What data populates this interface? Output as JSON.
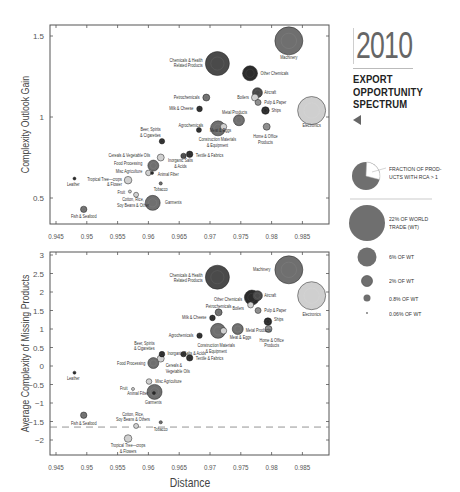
{
  "panel": {
    "year": "2010",
    "title_lines": [
      "EXPORT",
      "OPPORTUNITY",
      "SPECTRUM"
    ],
    "arrow_icon": "left-triangle"
  },
  "legend": {
    "pie_label": "FRACTION OF PROD-UCTS WITH RCA > 1",
    "pie_label_lines": [
      "FRACTION OF PROD-",
      "UCTS WITH RCA > 1"
    ],
    "sizes": [
      {
        "label_lines": [
          "22% OF WORLD",
          "TRADE (WT)"
        ],
        "r": 18
      },
      {
        "label_lines": [
          "6% OF WT"
        ],
        "r": 9.5
      },
      {
        "label_lines": [
          "2% OF WT"
        ],
        "r": 5.5
      },
      {
        "label_lines": [
          "0.8% OF WT"
        ],
        "r": 3.5
      },
      {
        "label_lines": [
          "0.06% OF WT"
        ],
        "r": 0.9
      }
    ]
  },
  "colors": {
    "dark": "#2b2b2b",
    "darkgray": "#4a4a4a",
    "mid": "#6f6f6f",
    "midlight": "#8c8c8c",
    "light": "#cfcfcf",
    "frame": "#555555",
    "dashed": "#777777"
  },
  "chart_data": [
    {
      "type": "scatter",
      "title": "",
      "xlabel": "",
      "ylabel": "Complexity Outlook Gain",
      "xlim": [
        0.943,
        0.9895
      ],
      "ylim": [
        0.36,
        1.56
      ],
      "xticks": [
        0.945,
        0.95,
        0.955,
        0.96,
        0.965,
        0.97,
        0.975,
        0.98,
        0.985
      ],
      "xtick_labels": [
        "0.945",
        "0.95",
        "0.955",
        "0.96",
        "0.965",
        "0.97",
        "0.975",
        "0.98",
        "0.985"
      ],
      "yticks": [
        0.5,
        1,
        1.5
      ],
      "ytick_labels": [
        "0.5",
        "1",
        "1.5"
      ],
      "points": [
        {
          "name": "Machinery",
          "x": 0.9828,
          "y": 1.47,
          "r": 14,
          "fill": "mid",
          "label": [
            "Machinery"
          ],
          "lx": 0.9828,
          "ly": 1.37,
          "anchor": "middle"
        },
        {
          "name": "Chemicals & Health Related Products",
          "x": 0.9712,
          "y": 1.33,
          "r": 12,
          "fill": "darkgray",
          "label": [
            "Chemicals & Health",
            "Related Products"
          ],
          "lx": 0.9688,
          "ly": 1.35,
          "anchor": "end"
        },
        {
          "name": "Other Chemicals",
          "x": 0.9765,
          "y": 1.27,
          "r": 7.5,
          "fill": "dark",
          "label": [
            "Other Chemicals"
          ],
          "lx": 0.9782,
          "ly": 1.27,
          "anchor": "start"
        },
        {
          "name": "Electronics",
          "x": 0.9865,
          "y": 1.04,
          "r": 14,
          "fill": "light",
          "label": [
            "Electronics"
          ],
          "lx": 0.9865,
          "ly": 0.95,
          "anchor": "middle"
        },
        {
          "name": "Aircraft",
          "x": 0.9777,
          "y": 1.15,
          "r": 5,
          "fill": "darkgray",
          "label": [
            "Aircraft"
          ],
          "lx": 0.9788,
          "ly": 1.15,
          "anchor": "start"
        },
        {
          "name": "Boilers",
          "x": 0.9773,
          "y": 1.12,
          "r": 3.5,
          "fill": "light",
          "label": [
            "Boilers"
          ],
          "lx": 0.9763,
          "ly": 1.12,
          "anchor": "end"
        },
        {
          "name": "Pulp & Paper",
          "x": 0.9778,
          "y": 1.09,
          "r": 3,
          "fill": "midlight",
          "label": [
            "Pulp & Paper"
          ],
          "lx": 0.9788,
          "ly": 1.09,
          "anchor": "start"
        },
        {
          "name": "Ships",
          "x": 0.979,
          "y": 1.04,
          "r": 3.8,
          "fill": "dark",
          "label": [
            "Ships"
          ],
          "lx": 0.98,
          "ly": 1.04,
          "anchor": "start"
        },
        {
          "name": "Petrochemicals",
          "x": 0.9694,
          "y": 1.12,
          "r": 3.5,
          "fill": "mid",
          "label": [
            "Petrochemicals"
          ],
          "lx": 0.9683,
          "ly": 1.12,
          "anchor": "end"
        },
        {
          "name": "Milk & Cheese",
          "x": 0.9683,
          "y": 1.05,
          "r": 2.8,
          "fill": "dark",
          "label": [
            "Milk & Cheese"
          ],
          "lx": 0.9673,
          "ly": 1.05,
          "anchor": "end"
        },
        {
          "name": "Metal Products",
          "x": 0.9747,
          "y": 0.98,
          "r": 5.5,
          "fill": "mid",
          "label": [
            "Metal Products"
          ],
          "lx": 0.974,
          "ly": 1.03,
          "anchor": "middle"
        },
        {
          "name": "Home & Office Products",
          "x": 0.9792,
          "y": 0.94,
          "r": 3.5,
          "fill": "midlight",
          "label": [
            "Home & Office",
            "Products"
          ],
          "lx": 0.979,
          "ly": 0.88,
          "anchor": "middle"
        },
        {
          "name": "Construction Materials & Equipment",
          "x": 0.9713,
          "y": 0.93,
          "r": 7.5,
          "fill": "mid",
          "label": [
            "Construction Materials",
            "& Equipment"
          ],
          "lx": 0.9712,
          "ly": 0.86,
          "anchor": "middle"
        },
        {
          "name": "Meat & Eggs",
          "x": 0.9722,
          "y": 0.94,
          "r": 3.2,
          "fill": "light",
          "label": [
            "Meat & Eggs"
          ],
          "lx": 0.9717,
          "ly": 0.915,
          "anchor": "middle"
        },
        {
          "name": "Agrochemicals",
          "x": 0.9682,
          "y": 0.92,
          "r": 2.5,
          "fill": "dark",
          "label": [
            "Agrochemicals"
          ],
          "lx": 0.9689,
          "ly": 0.945,
          "anchor": "end"
        },
        {
          "name": "Beer, Spirits & Cigarettes",
          "x": 0.9622,
          "y": 0.85,
          "r": 2.7,
          "fill": "dark",
          "label": [
            "Beer, Spirits",
            "& Cigarettes"
          ],
          "lx": 0.962,
          "ly": 0.92,
          "anchor": "end"
        },
        {
          "name": "Textile & Fabrics",
          "x": 0.9667,
          "y": 0.77,
          "r": 3.2,
          "fill": "dark",
          "label": [
            "Textile & Fabrics"
          ],
          "lx": 0.9677,
          "ly": 0.765,
          "anchor": "start"
        },
        {
          "name": "Inorganic Salts & Acids",
          "x": 0.9657,
          "y": 0.76,
          "r": 2.7,
          "fill": "darkgray",
          "label": [
            "Inorganic Salts",
            "& Acids"
          ],
          "lx": 0.9652,
          "ly": 0.73,
          "anchor": "middle"
        },
        {
          "name": "Cereals & Vegetable Oils",
          "x": 0.962,
          "y": 0.75,
          "r": 3.5,
          "fill": "light",
          "label": [
            "Cereals & Vegetable Oils"
          ],
          "lx": 0.9603,
          "ly": 0.765,
          "anchor": "end"
        },
        {
          "name": "Food Processing",
          "x": 0.9608,
          "y": 0.7,
          "r": 5.5,
          "fill": "mid",
          "label": [
            "Food Processing"
          ],
          "lx": 0.959,
          "ly": 0.71,
          "anchor": "end"
        },
        {
          "name": "Misc Agriculture",
          "x": 0.96,
          "y": 0.655,
          "r": 2.8,
          "fill": "light",
          "label": [
            "Misc Agriculture"
          ],
          "lx": 0.959,
          "ly": 0.665,
          "anchor": "end"
        },
        {
          "name": "Animal Fiber",
          "x": 0.9606,
          "y": 0.655,
          "r": 1.5,
          "fill": "dark",
          "label": [
            "Animal Fiber"
          ],
          "lx": 0.9615,
          "ly": 0.645,
          "anchor": "start"
        },
        {
          "name": "Tropical Tree-crops & Flower",
          "x": 0.9567,
          "y": 0.61,
          "r": 3.8,
          "fill": "light",
          "label": [
            "Tropical Tree—crops",
            "& Flower"
          ],
          "lx": 0.9557,
          "ly": 0.615,
          "anchor": "end"
        },
        {
          "name": "Leather",
          "x": 0.948,
          "y": 0.62,
          "r": 1.5,
          "fill": "dark",
          "label": [
            "Leather"
          ],
          "lx": 0.9478,
          "ly": 0.585,
          "anchor": "middle"
        },
        {
          "name": "Tobacco",
          "x": 0.962,
          "y": 0.59,
          "r": 1.6,
          "fill": "mid",
          "label": [
            "Tobacco"
          ],
          "lx": 0.962,
          "ly": 0.555,
          "anchor": "middle"
        },
        {
          "name": "Fruit",
          "x": 0.957,
          "y": 0.54,
          "r": 1.5,
          "fill": "light",
          "label": [
            "Fruit"
          ],
          "lx": 0.9562,
          "ly": 0.535,
          "anchor": "end"
        },
        {
          "name": "Cotton, Rice, Soy Beans & Others",
          "x": 0.958,
          "y": 0.52,
          "r": 2.5,
          "fill": "light",
          "label": [
            "Cotton, Rice,",
            "Soy Beans & Other"
          ],
          "lx": 0.9575,
          "ly": 0.49,
          "anchor": "middle"
        },
        {
          "name": "Garments",
          "x": 0.9607,
          "y": 0.47,
          "r": 7.5,
          "fill": "mid",
          "label": [
            "Garments"
          ],
          "lx": 0.9627,
          "ly": 0.47,
          "anchor": "start"
        },
        {
          "name": "Fish & Seafood",
          "x": 0.9495,
          "y": 0.43,
          "r": 3.2,
          "fill": "mid",
          "label": [
            "Fish & Seafood"
          ],
          "lx": 0.9495,
          "ly": 0.385,
          "anchor": "middle"
        }
      ]
    },
    {
      "type": "scatter",
      "title": "",
      "xlabel": "Distance",
      "ylabel": "Average Complexity of Missing Products",
      "xlim": [
        0.943,
        0.9895
      ],
      "ylim": [
        -2.4,
        3.03
      ],
      "xticks": [
        0.945,
        0.95,
        0.955,
        0.96,
        0.965,
        0.97,
        0.975,
        0.98,
        0.985
      ],
      "xtick_labels": [
        "0.945",
        "0.95",
        "0.955",
        "0.96",
        "0.965",
        "0.97",
        "0.975",
        "0.98",
        "0.985"
      ],
      "yticks": [
        3,
        2.5,
        2,
        1.5,
        1,
        0.5,
        0,
        -0.5,
        -1,
        -1.5,
        -2
      ],
      "ytick_labels": [
        "3",
        "2.5",
        "2",
        "1.5",
        "1",
        "0.5",
        "0",
        "−0.5",
        "−1",
        "−1.5",
        "−2"
      ],
      "reference_line": {
        "y": -1.65,
        "style": "dashed"
      },
      "points": [
        {
          "name": "Machinery",
          "x": 0.9828,
          "y": 2.6,
          "r": 14,
          "fill": "mid",
          "label": [
            "Machinery"
          ],
          "lx": 0.9798,
          "ly": 2.62,
          "anchor": "end"
        },
        {
          "name": "Chemicals & Health Related Products",
          "x": 0.9712,
          "y": 2.4,
          "r": 12,
          "fill": "darkgray",
          "label": [
            "Chemicals & Health",
            "Related Products"
          ],
          "lx": 0.9688,
          "ly": 2.45,
          "anchor": "end"
        },
        {
          "name": "Electronics",
          "x": 0.9865,
          "y": 1.9,
          "r": 14,
          "fill": "light",
          "label": [
            "Electronics"
          ],
          "lx": 0.9865,
          "ly": 1.4,
          "anchor": "middle"
        },
        {
          "name": "Other Chemicals",
          "x": 0.9768,
          "y": 1.85,
          "r": 7.5,
          "fill": "dark",
          "label": [
            "Other Chemicals"
          ],
          "lx": 0.9752,
          "ly": 1.8,
          "anchor": "end"
        },
        {
          "name": "Aircraft",
          "x": 0.9777,
          "y": 1.9,
          "r": 5,
          "fill": "darkgray",
          "label": [
            "Aircraft"
          ],
          "lx": 0.9788,
          "ly": 1.9,
          "anchor": "start"
        },
        {
          "name": "Boilers",
          "x": 0.9766,
          "y": 1.65,
          "r": 3,
          "fill": "light",
          "label": [
            "Boilers"
          ],
          "lx": 0.9755,
          "ly": 1.55,
          "anchor": "end"
        },
        {
          "name": "Pulp & Paper",
          "x": 0.9778,
          "y": 1.5,
          "r": 3,
          "fill": "midlight",
          "label": [
            "Pulp & Paper"
          ],
          "lx": 0.9788,
          "ly": 1.5,
          "anchor": "start"
        },
        {
          "name": "Petrochemicals",
          "x": 0.9714,
          "y": 1.45,
          "r": 3.5,
          "fill": "mid",
          "label": [
            "Petrochemicals"
          ],
          "lx": 0.9714,
          "ly": 1.6,
          "anchor": "middle"
        },
        {
          "name": "Ships",
          "x": 0.9794,
          "y": 1.2,
          "r": 3.8,
          "fill": "dark",
          "label": [
            "Ships"
          ],
          "lx": 0.9804,
          "ly": 1.25,
          "anchor": "start"
        },
        {
          "name": "Milk & Cheese",
          "x": 0.9704,
          "y": 1.3,
          "r": 2.8,
          "fill": "dark",
          "label": [
            "Milk & Cheese"
          ],
          "lx": 0.9694,
          "ly": 1.3,
          "anchor": "end"
        },
        {
          "name": "Metal Products",
          "x": 0.9745,
          "y": 1.0,
          "r": 5.5,
          "fill": "mid",
          "label": [
            "Metal Products"
          ],
          "lx": 0.9758,
          "ly": 0.95,
          "anchor": "start"
        },
        {
          "name": "Home & Office Products",
          "x": 0.9795,
          "y": 1.0,
          "r": 3.5,
          "fill": "midlight",
          "label": [
            "Home & Office",
            "Products"
          ],
          "lx": 0.98,
          "ly": 0.7,
          "anchor": "middle"
        },
        {
          "name": "Construction Materials & Equipment",
          "x": 0.9713,
          "y": 0.95,
          "r": 7.5,
          "fill": "mid",
          "label": [
            "Construction Materials",
            "& Equipment"
          ],
          "lx": 0.971,
          "ly": 0.55,
          "anchor": "middle"
        },
        {
          "name": "Meat & Eggs",
          "x": 0.9722,
          "y": 0.95,
          "r": 3.2,
          "fill": "light",
          "label": [
            "Meat & Eggs"
          ],
          "lx": 0.9732,
          "ly": 0.78,
          "anchor": "start"
        },
        {
          "name": "Agrochemicals",
          "x": 0.9683,
          "y": 0.82,
          "r": 2.7,
          "fill": "dark",
          "label": [
            "Agrochemicals"
          ],
          "lx": 0.9673,
          "ly": 0.82,
          "anchor": "end"
        },
        {
          "name": "Beer, Spirits & Cigarettes",
          "x": 0.9622,
          "y": 0.32,
          "r": 2.8,
          "fill": "dark",
          "label": [
            "Beer, Spirits",
            "& Cigarettes"
          ],
          "lx": 0.961,
          "ly": 0.62,
          "anchor": "end"
        },
        {
          "name": "Inorganic Salts & Acids",
          "x": 0.9657,
          "y": 0.32,
          "r": 2.7,
          "fill": "dark",
          "label": [
            "Inorganic Salts & Acids"
          ],
          "lx": 0.9662,
          "ly": 0.33,
          "anchor": "middle"
        },
        {
          "name": "Textile & Fabrics",
          "x": 0.9667,
          "y": 0.22,
          "r": 3.2,
          "fill": "dark",
          "label": [
            "Textile & Fabrics"
          ],
          "lx": 0.9677,
          "ly": 0.2,
          "anchor": "start"
        },
        {
          "name": "Cereals & Vegetable Oils",
          "x": 0.962,
          "y": 0.2,
          "r": 3.5,
          "fill": "light",
          "label": [
            "Cereals &",
            "Vegetable Oils"
          ],
          "lx": 0.9628,
          "ly": 0.0,
          "anchor": "start"
        },
        {
          "name": "Food Processing",
          "x": 0.9608,
          "y": 0.08,
          "r": 5.5,
          "fill": "mid",
          "label": [
            "Food Processing"
          ],
          "lx": 0.9595,
          "ly": 0.08,
          "anchor": "end"
        },
        {
          "name": "Leather",
          "x": 0.948,
          "y": -0.18,
          "r": 1.5,
          "fill": "dark",
          "label": [
            "Leather"
          ],
          "lx": 0.9478,
          "ly": -0.35,
          "anchor": "middle"
        },
        {
          "name": "Misc Agriculture",
          "x": 0.9601,
          "y": -0.42,
          "r": 2.8,
          "fill": "light",
          "label": [
            "Misc Agriculture"
          ],
          "lx": 0.9611,
          "ly": -0.42,
          "anchor": "start"
        },
        {
          "name": "Fruit",
          "x": 0.9575,
          "y": -0.62,
          "r": 1.5,
          "fill": "light",
          "label": [
            "Fruit"
          ],
          "lx": 0.9566,
          "ly": -0.62,
          "anchor": "end"
        },
        {
          "name": "Animal Fiber",
          "x": 0.9609,
          "y": -0.73,
          "r": 1.5,
          "fill": "dark",
          "label": [
            "Animal Fiber"
          ],
          "lx": 0.96,
          "ly": -0.75,
          "anchor": "end"
        },
        {
          "name": "Garments",
          "x": 0.961,
          "y": -0.7,
          "r": 7.5,
          "fill": "mid",
          "label": [
            "Garments"
          ],
          "lx": 0.9608,
          "ly": -1.0,
          "anchor": "middle"
        },
        {
          "name": "Fish & Seafood",
          "x": 0.9495,
          "y": -1.33,
          "r": 3.2,
          "fill": "mid",
          "label": [
            "Fish & Seafood"
          ],
          "lx": 0.9495,
          "ly": -1.55,
          "anchor": "middle"
        },
        {
          "name": "Cotton, Rice, Soy Beans & Others",
          "x": 0.958,
          "y": -1.62,
          "r": 2.5,
          "fill": "light",
          "label": [
            "Cotton, Rice,",
            "Soy Beans & Others"
          ],
          "lx": 0.9575,
          "ly": -1.3,
          "anchor": "middle"
        },
        {
          "name": "Tobacco",
          "x": 0.962,
          "y": -1.52,
          "r": 1.6,
          "fill": "mid",
          "label": [
            "Tobacco"
          ],
          "lx": 0.962,
          "ly": -1.72,
          "anchor": "middle"
        },
        {
          "name": "Tropical Tree-crops & Flowers",
          "x": 0.9567,
          "y": -1.96,
          "r": 3.8,
          "fill": "light",
          "label": [
            "Tropical Tree—crops",
            "& Flowers"
          ],
          "lx": 0.9567,
          "ly": -2.15,
          "anchor": "middle"
        }
      ]
    }
  ]
}
